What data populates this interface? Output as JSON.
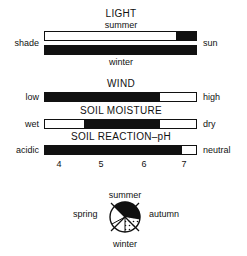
{
  "light": {
    "title": "LIGHT",
    "top_label": "summer",
    "bottom_label": "winter",
    "left_label": "shade",
    "right_label": "sun",
    "summer_bar": {
      "filled_from": 0.87,
      "filled_to": 1.0
    },
    "winter_bar": {
      "filled_from": 0.0,
      "filled_to": 1.0
    }
  },
  "wind": {
    "title": "WIND",
    "left_label": "low",
    "right_label": "high",
    "bar": {
      "filled_from": 0.0,
      "filled_to": 0.76
    }
  },
  "soil_moisture": {
    "title": "SOIL MOISTURE",
    "left_label": "wet",
    "right_label": "dry",
    "bar": {
      "filled_from": 0.26,
      "filled_to": 0.76
    }
  },
  "soil_reaction": {
    "title": "SOIL REACTION–pH",
    "left_label": "acidic",
    "right_label": "neutral",
    "bar": {
      "filled_from": 0.0,
      "filled_to": 0.91
    },
    "scale_ticks": [
      "4",
      "5",
      "6",
      "7"
    ]
  },
  "seasons": {
    "labels": {
      "top": "summer",
      "left": "spring",
      "right": "autumn",
      "bottom": "winter"
    },
    "segments": [
      {
        "name": "spring",
        "fill": "empty"
      },
      {
        "name": "summer",
        "fill": "solid"
      },
      {
        "name": "autumn",
        "fill": "solid"
      },
      {
        "name": "winter",
        "fill": "dotted"
      }
    ]
  },
  "colors": {
    "ink": "#111111",
    "paper": "#ffffff"
  }
}
